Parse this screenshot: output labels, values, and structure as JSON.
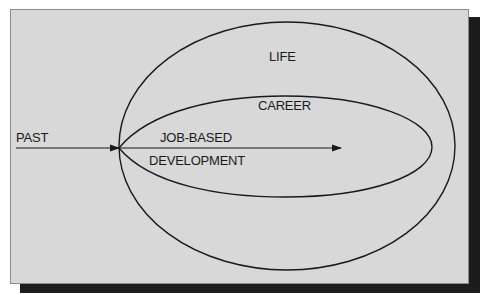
{
  "diagram": {
    "type": "nested-domains",
    "colors": {
      "background": "#ffffff",
      "panel": "#d8d8d8",
      "panel_border": "#8a8a8a",
      "shadow": "#1c1c1c",
      "stroke": "#1a1a1a",
      "text": "#1a1a1a"
    },
    "labels": {
      "outer": "LIFE",
      "inner": "CAREER",
      "arrow_start": "PAST",
      "arrow_top": "JOB-BASED",
      "arrow_bottom": "DEVELOPMENT"
    },
    "nodes": [
      {
        "id": "life",
        "shape": "ellipse",
        "label": "LIFE"
      },
      {
        "id": "career",
        "shape": "teardrop",
        "label": "CAREER",
        "contained_in": "life"
      }
    ],
    "edges": [
      {
        "from": "PAST",
        "to": "career-interior",
        "style": "arrow",
        "label": "JOB-BASED DEVELOPMENT"
      }
    ]
  }
}
